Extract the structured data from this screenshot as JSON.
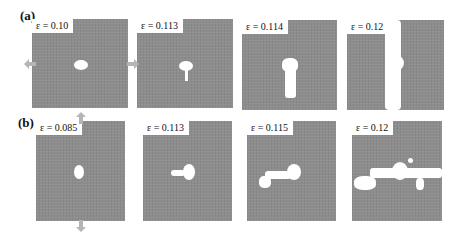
{
  "figure": {
    "rows": [
      {
        "label": "(a)",
        "loading": "horizontal tension",
        "panels": [
          {
            "strain_label": "ε = 0.10"
          },
          {
            "strain_label": "ε = 0.113"
          },
          {
            "strain_label": "ε = 0.114"
          },
          {
            "strain_label": "ε = 0.12"
          }
        ]
      },
      {
        "label": "(b)",
        "loading": "vertical tension",
        "panels": [
          {
            "strain_label": "ε = 0.085"
          },
          {
            "strain_label": "ε = 0.113"
          },
          {
            "strain_label": "ε = 0.115"
          },
          {
            "strain_label": "ε = 0.12"
          }
        ]
      }
    ],
    "colors": {
      "material": "#8d8d8d",
      "void": "#ffffff",
      "arrow": "#b5b5b5"
    }
  }
}
